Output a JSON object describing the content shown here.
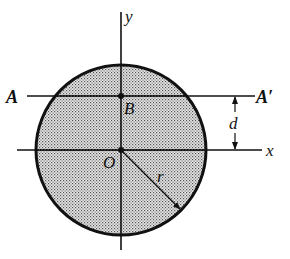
{
  "figure": {
    "type": "geometry-diagram",
    "colors": {
      "line": "#111111",
      "fill_dots": "#555555",
      "background": "#ffffff"
    },
    "circle": {
      "cx": 121,
      "cy": 150,
      "r": 85
    },
    "axes": {
      "x_label": "x",
      "y_label": "y"
    },
    "points": {
      "origin_label": "O",
      "b_label": "B"
    },
    "reference_line": {
      "left_label": "A",
      "right_label": "A′",
      "y": 96
    },
    "dimensions": {
      "offset_label": "d",
      "radius_label": "r"
    }
  }
}
